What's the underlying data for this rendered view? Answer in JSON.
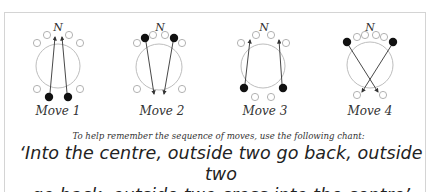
{
  "diagram": {
    "north_label": "N",
    "moves": [
      {
        "label": "Move 1",
        "center_x": 58
      },
      {
        "label": "Move 2",
        "center_x": 160
      },
      {
        "label": "Move 3",
        "center_x": 265
      },
      {
        "label": "Move 4",
        "center_x": 370
      }
    ],
    "colors": {
      "border": "#d4d4d4",
      "circle_outline": "#b5b5b5",
      "dot_filled": "#111111",
      "arrow": "#333333",
      "text": "#333333"
    }
  },
  "hint_text": "To help remember the sequence of moves, use the following chant:",
  "chant_line1": "‘Into the centre, outside two go back, outside two",
  "chant_line2": "go back, outside two cross into the centre’"
}
